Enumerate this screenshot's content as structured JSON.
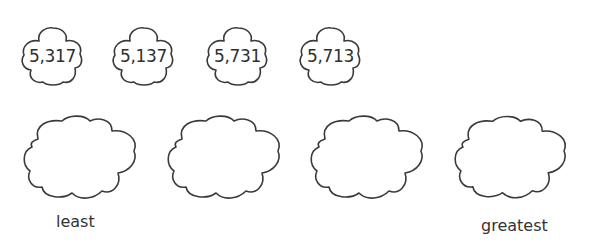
{
  "numbers": [
    {
      "value": "5,317"
    },
    {
      "value": "5,137"
    },
    {
      "value": "5,731"
    },
    {
      "value": "5,713"
    }
  ],
  "answer_boxes": [
    {
      "value": ""
    },
    {
      "value": ""
    },
    {
      "value": ""
    },
    {
      "value": ""
    }
  ],
  "labels": {
    "least": "least",
    "greatest": "greatest"
  }
}
